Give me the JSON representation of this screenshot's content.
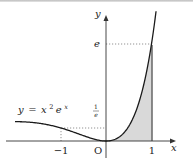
{
  "diagram": {
    "type": "function-graph",
    "function_label": {
      "y": "y",
      "eq": "=",
      "x": "x",
      "exp2": "2",
      "e": "e",
      "expx": "x"
    },
    "axes": {
      "x_label": "x",
      "y_label": "y",
      "origin_label": "O"
    },
    "x_ticks": [
      {
        "label": "−1",
        "value": -1
      },
      {
        "label": "1",
        "value": 1
      }
    ],
    "y_ticks": [
      {
        "label": "e",
        "value": 2.718
      },
      {
        "label_num": "1",
        "label_den": "e",
        "value": 0.368
      }
    ],
    "shaded_region": {
      "from": 0,
      "to": 1,
      "color": "#d9d9d9"
    },
    "colors": {
      "curve": "#1a1a1a",
      "axes": "#333333",
      "shade": "#d9d9d9",
      "dotted": "#666666"
    }
  }
}
